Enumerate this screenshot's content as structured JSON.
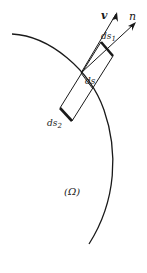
{
  "diagram": {
    "labels": {
      "velocity": "v",
      "normal": "n",
      "ds1_base": "ds",
      "ds1_sub": "1",
      "ds": "ds",
      "ds2_base": "ds",
      "ds2_sub": "2",
      "region": "(Ω)"
    },
    "colors": {
      "stroke": "#1a1a1a",
      "background": "#ffffff"
    }
  }
}
